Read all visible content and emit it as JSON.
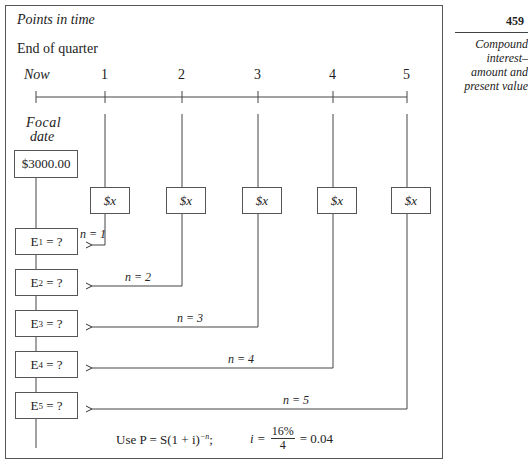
{
  "sidebar": {
    "page_number": "459",
    "section_title_lines": [
      "Compound",
      "interest–",
      "amount and",
      "present value"
    ]
  },
  "diagram": {
    "title": "Points in time",
    "axis_label": "End of quarter",
    "ticks": [
      "Now",
      "1",
      "2",
      "3",
      "4",
      "5"
    ],
    "focal_label_lines": [
      "Focal",
      "date"
    ],
    "principal": "$3000.00",
    "payments": [
      "$x",
      "$x",
      "$x",
      "$x",
      "$x"
    ],
    "equivalents": [
      {
        "label": "E",
        "sub": "1",
        "rest": " = ?"
      },
      {
        "label": "E",
        "sub": "2",
        "rest": " = ?"
      },
      {
        "label": "E",
        "sub": "3",
        "rest": " = ?"
      },
      {
        "label": "E",
        "sub": "4",
        "rest": " = ?"
      },
      {
        "label": "E",
        "sub": "5",
        "rest": " = ?"
      }
    ],
    "n_labels": [
      "n = 1",
      "n = 2",
      "n = 3",
      "n = 4",
      "n = 5"
    ],
    "formula": {
      "use_text": "Use P = S(1 + i)",
      "exponent": "−n",
      "semicolon": ";",
      "i_eq": "i =",
      "numerator": "16%",
      "denominator": "4",
      "result": "= 0.04"
    }
  }
}
